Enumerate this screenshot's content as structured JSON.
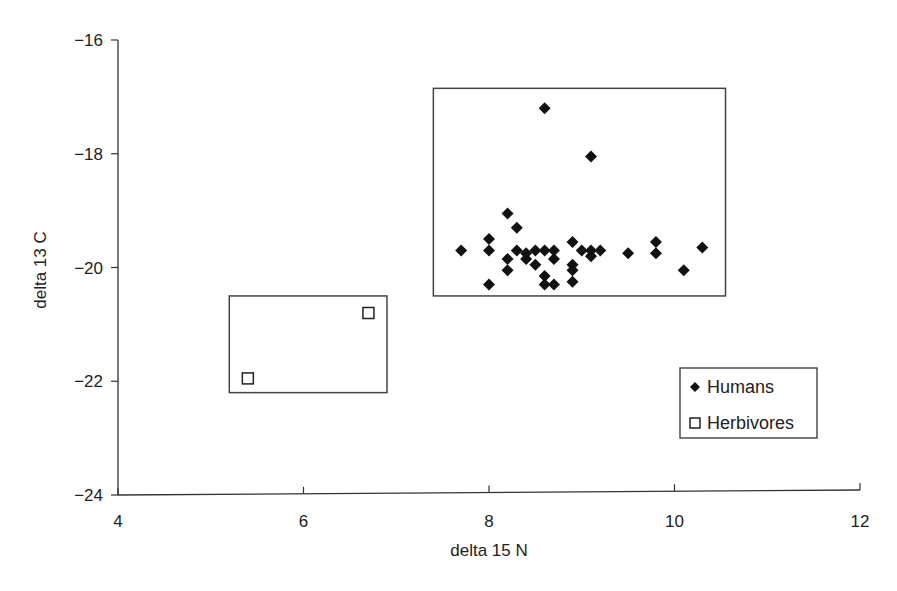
{
  "chart_data": {
    "type": "scatter",
    "title": "",
    "xlabel": "delta 15 N",
    "ylabel": "delta 13 C",
    "xlim": [
      4,
      12
    ],
    "ylim": [
      -24,
      -16
    ],
    "x_ticks": [
      4,
      6,
      8,
      10,
      12
    ],
    "y_ticks": [
      -16,
      -18,
      -20,
      -22,
      -24
    ],
    "x_tick_labels": [
      "4",
      "6",
      "8",
      "10",
      "12"
    ],
    "y_tick_labels": [
      "−16",
      "−18",
      "−20",
      "−22",
      "−24"
    ],
    "grid": false,
    "legend_position": "lower right",
    "series": [
      {
        "name": "Humans",
        "marker": "filled-diamond",
        "color": "#111111",
        "points": [
          [
            8.6,
            -17.2
          ],
          [
            9.1,
            -18.05
          ],
          [
            7.7,
            -19.7
          ],
          [
            8.0,
            -19.5
          ],
          [
            8.0,
            -19.7
          ],
          [
            8.0,
            -20.3
          ],
          [
            8.2,
            -19.05
          ],
          [
            8.2,
            -19.85
          ],
          [
            8.2,
            -20.05
          ],
          [
            8.3,
            -19.3
          ],
          [
            8.3,
            -19.7
          ],
          [
            8.4,
            -19.75
          ],
          [
            8.4,
            -19.85
          ],
          [
            8.5,
            -19.7
          ],
          [
            8.5,
            -19.95
          ],
          [
            8.6,
            -19.7
          ],
          [
            8.6,
            -20.15
          ],
          [
            8.6,
            -20.3
          ],
          [
            8.7,
            -19.7
          ],
          [
            8.7,
            -19.85
          ],
          [
            8.7,
            -20.3
          ],
          [
            8.9,
            -19.55
          ],
          [
            8.9,
            -19.95
          ],
          [
            8.9,
            -20.05
          ],
          [
            8.9,
            -20.25
          ],
          [
            9.0,
            -19.7
          ],
          [
            9.1,
            -19.7
          ],
          [
            9.1,
            -19.8
          ],
          [
            9.2,
            -19.7
          ],
          [
            9.5,
            -19.75
          ],
          [
            9.8,
            -19.55
          ],
          [
            9.8,
            -19.75
          ],
          [
            10.1,
            -20.05
          ],
          [
            10.3,
            -19.65
          ]
        ]
      },
      {
        "name": "Herbivores",
        "marker": "open-square",
        "color": "#ffffff",
        "points": [
          [
            5.4,
            -21.95
          ],
          [
            6.7,
            -20.8
          ]
        ]
      }
    ],
    "annotations": [
      {
        "type": "rectangle",
        "label": "Humans range box",
        "x": [
          7.4,
          10.55
        ],
        "y": [
          -20.5,
          -16.85
        ]
      },
      {
        "type": "rectangle",
        "label": "Herbivores range box",
        "x": [
          5.2,
          6.9
        ],
        "y": [
          -22.2,
          -20.5
        ]
      }
    ]
  },
  "legend": {
    "items": [
      {
        "label": "Humans",
        "icon": "filled-diamond-icon"
      },
      {
        "label": "Herbivores",
        "icon": "open-square-icon"
      }
    ]
  }
}
